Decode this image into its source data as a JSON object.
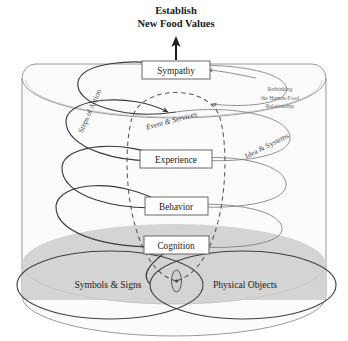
{
  "diagram": {
    "title_lines": [
      "Establish",
      "New Food Values"
    ],
    "stage_boxes": [
      {
        "label": "Sympathy",
        "cx": 175,
        "cy": 70
      },
      {
        "label": "Experience",
        "cx": 175,
        "cy": 159
      },
      {
        "label": "Behavior",
        "cx": 175,
        "cy": 206
      },
      {
        "label": "Cognition",
        "cx": 175,
        "cy": 245
      }
    ],
    "base_ellipses": [
      {
        "label": "Symbols & Signs",
        "cx": 110,
        "cy": 285
      },
      {
        "label": "Physical Objects",
        "cx": 243,
        "cy": 285
      }
    ],
    "spiral_label": "Steps of Action",
    "dashed_ellipse_label": "Event & Services",
    "outer_right_label": "Idea & Systems",
    "side_note_lines": [
      "Rethinking",
      "the Human-Food",
      "Relationship"
    ],
    "colors": {
      "stroke": "#3a3a3a",
      "light_stroke": "#8f8f8f",
      "gray_fill": "#d4d4d4",
      "vessel_fill": "#fbfbfb",
      "box_fill": "#ffffff",
      "text": "#222222"
    }
  }
}
